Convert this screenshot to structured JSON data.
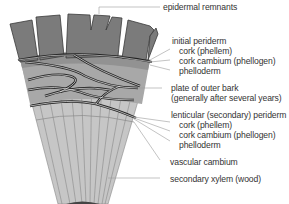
{
  "diagram": {
    "colors": {
      "outer_bark": "#7a7a7a",
      "phelloderm_band": "#9a9a9a",
      "inner_tissue": "#b8b8b8",
      "xylem": "#c8c8c8",
      "periderm_line": "#2a2a2a",
      "leader_line": "#9a9a9a",
      "text": "#333333"
    }
  },
  "labels": {
    "epidermal_remnants": "epidermal remnants",
    "initial_periderm": "initial periderm",
    "initial_cork": "cork (phellem)",
    "initial_cork_cambium": "cork cambium (phellogen)",
    "initial_phelloderm": "phelloderm",
    "plate_outer_bark_1": "plate of outer bark",
    "plate_outer_bark_2": "(generally after several years)",
    "lenticular_periderm": "lenticular (secondary) periderm",
    "lenticular_cork": "cork (phellem)",
    "lenticular_cork_cambium": "cork cambium (phellogen)",
    "lenticular_phelloderm": "phelloderm",
    "vascular_cambium": "vascular cambium",
    "secondary_xylem": "secondary xylem (wood)"
  }
}
